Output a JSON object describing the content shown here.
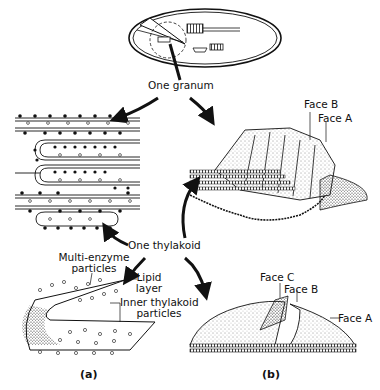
{
  "diagram": {
    "type": "biological-structure-illustration",
    "labels": {
      "granum": "One granum",
      "thylakoid": "One thylakoid",
      "multi_enzyme": "Multi-enzyme\nparticles",
      "multi_enzyme_line1": "Multi-enzyme",
      "multi_enzyme_line2": "particles",
      "lipid_line1": "Lipid",
      "lipid_line2": "layer",
      "inner_line1": "Inner thylakoid",
      "inner_line2": "particles",
      "top_face_b": "Face B",
      "top_face_a": "Face A",
      "bottom_face_c": "Face C",
      "bottom_face_b": "Face B",
      "bottom_face_a": "Face A"
    },
    "panels": {
      "a": "(a)",
      "b": "(b)"
    },
    "parts": [
      "chloroplast-overview",
      "granum-cross-section-stack",
      "granum-freeze-fracture-3d",
      "single-thylakoid-cutaway",
      "single-thylakoid-freeze-fracture"
    ],
    "colors": {
      "ink": "#111111",
      "background": "#ffffff"
    }
  }
}
